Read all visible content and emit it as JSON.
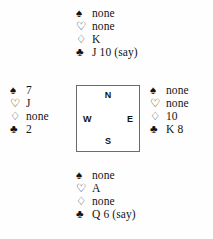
{
  "diagram": {
    "type": "bridge-hand-diagram",
    "suit_symbols": {
      "spades": "♠",
      "hearts": "♡",
      "diamonds": "♢",
      "clubs": "♣"
    },
    "compass": {
      "north": "N",
      "west": "W",
      "east": "E",
      "south": "S"
    },
    "hands": {
      "north": {
        "spades": "none",
        "hearts": "none",
        "diamonds": "K",
        "clubs": "J 10 (say)"
      },
      "west": {
        "spades": "7",
        "hearts": "J",
        "diamonds": "none",
        "clubs": "2"
      },
      "east": {
        "spades": "none",
        "hearts": "none",
        "diamonds": "10",
        "clubs": "K 8"
      },
      "south": {
        "spades": "none",
        "hearts": "A",
        "diamonds": "none",
        "clubs": "Q 6 (say)"
      }
    }
  }
}
